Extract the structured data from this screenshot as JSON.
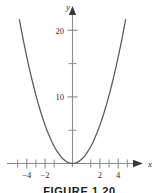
{
  "figure": {
    "caption": "FIGURE 1.20",
    "background_color": "#ffffff",
    "curve_color": "#595959",
    "axis_color": "#8c8c8c",
    "tick_color": "#8c8c8c",
    "text_color": "#2b2b2b"
  },
  "chart_data": {
    "type": "line",
    "title": "",
    "subtitle": "",
    "xlabel": "x",
    "ylabel": "y",
    "function": "y = x^2",
    "grid": false,
    "legend": null,
    "xlim": [
      -5.0,
      5.0
    ],
    "ylim": [
      -1.5,
      24.0
    ],
    "x_ticks_major": [
      -4,
      -2,
      2,
      4
    ],
    "x_tick_labels": [
      "−4",
      "−2",
      "2",
      "4"
    ],
    "x_ticks_minor": [
      -5,
      -3,
      -1,
      1,
      3,
      5
    ],
    "y_ticks_major": [
      10,
      20
    ],
    "y_tick_labels": [
      "10",
      "20"
    ],
    "y_ticks_minor": [
      5,
      15
    ],
    "x": [
      -4.65,
      -4.4,
      -4.2,
      -4.0,
      -3.8,
      -3.6,
      -3.4,
      -3.2,
      -3.0,
      -2.8,
      -2.6,
      -2.4,
      -2.2,
      -2.0,
      -1.8,
      -1.6,
      -1.4,
      -1.2,
      -1.0,
      -0.8,
      -0.6,
      -0.4,
      -0.2,
      0.0,
      0.2,
      0.4,
      0.6,
      0.8,
      1.0,
      1.2,
      1.4,
      1.6,
      1.8,
      2.0,
      2.2,
      2.4,
      2.6,
      2.8,
      3.0,
      3.2,
      3.4,
      3.6,
      3.8,
      4.0,
      4.2,
      4.4,
      4.65
    ],
    "values": [
      21.6,
      19.36,
      17.64,
      16.0,
      14.44,
      12.96,
      11.56,
      10.24,
      9.0,
      7.84,
      6.76,
      5.76,
      4.84,
      4.0,
      3.24,
      2.56,
      1.96,
      1.44,
      1.0,
      0.64,
      0.36,
      0.16,
      0.04,
      0.0,
      0.04,
      0.16,
      0.36,
      0.64,
      1.0,
      1.44,
      1.96,
      2.56,
      3.24,
      4.0,
      4.84,
      5.76,
      6.76,
      7.84,
      9.0,
      10.24,
      11.56,
      12.96,
      14.44,
      16.0,
      17.64,
      19.36,
      21.6
    ],
    "annotations": []
  },
  "axes": {
    "x_axis_arrow": "arrow-right",
    "y_axis_arrow": "arrow-up",
    "x_axis_name": "x-axis",
    "y_axis_name": "y-axis"
  }
}
